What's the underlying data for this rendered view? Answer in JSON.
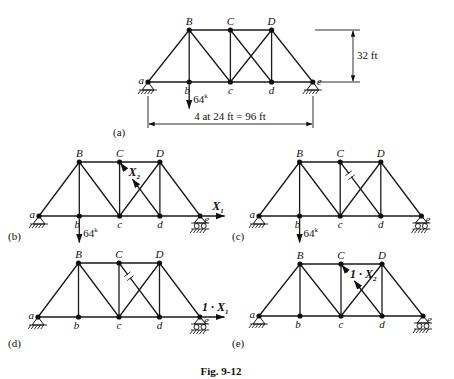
{
  "figure": {
    "caption": "Fig. 9-12",
    "node_labels": {
      "a": "a",
      "b": "b",
      "c": "c",
      "d": "d",
      "e": "e",
      "B": "B",
      "C": "C",
      "D": "D"
    },
    "load_label": "64",
    "load_unit_sup": "k",
    "height_label": "32 ft",
    "span_label": "4 at 24 ft = 96 ft",
    "panels": [
      {
        "id": "a",
        "label": "(a)",
        "ox": 148,
        "top": 30,
        "bot": 82,
        "dx": 41.2,
        "load": true,
        "diag_cut": false,
        "right_support": "pin",
        "x1": null,
        "x2": null
      },
      {
        "id": "b",
        "label": "(b)",
        "ox": 39,
        "top": 162,
        "bot": 216,
        "dx": 40.3,
        "load": true,
        "diag_cut": "arrows",
        "right_support": "roller",
        "x1": "X",
        "x1_sub": "1",
        "x2": "X",
        "x2_sub": "2"
      },
      {
        "id": "c",
        "label": "(c)",
        "ox": 259,
        "top": 162,
        "bot": 216,
        "dx": 40.6,
        "load": true,
        "diag_cut": "tick",
        "right_support": "roller",
        "x1": null,
        "x2": null
      },
      {
        "id": "d",
        "label": "(d)",
        "ox": 38,
        "top": 263,
        "bot": 317,
        "dx": 40.5,
        "load": false,
        "diag_cut": "tick",
        "right_support": "roller",
        "x1": "1 · X",
        "x1_sub": "1",
        "x2": null
      },
      {
        "id": "e",
        "label": "(e)",
        "ox": 259,
        "top": 264,
        "bot": 316,
        "dx": 41,
        "load": false,
        "diag_cut": "arrows",
        "right_support": "roller",
        "x1": null,
        "x2": "1 · X",
        "x2_sub": "2"
      }
    ]
  }
}
